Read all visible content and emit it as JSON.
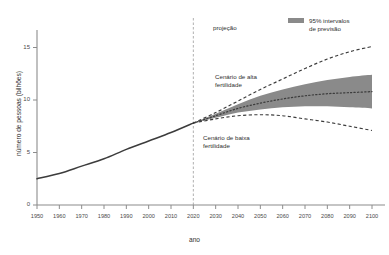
{
  "chart_data": {
    "type": "line",
    "title": "",
    "xlabel": "ano",
    "ylabel": "número de pessoas (bilhões)",
    "xlim": [
      1950,
      2100
    ],
    "ylim": [
      0,
      17
    ],
    "grid": false,
    "legend_position": "top-right",
    "x_ticks": [
      1950,
      1960,
      1970,
      1980,
      1990,
      2000,
      2010,
      2020,
      2030,
      2040,
      2050,
      2060,
      2070,
      2080,
      2090,
      2100
    ],
    "y_ticks": [
      0,
      5,
      10,
      15
    ],
    "projection_start_year": 2020,
    "legend": [
      {
        "label_line1": "95% intervalos",
        "label_line2": "de previsão",
        "color": "#8a8a8a",
        "style": "band"
      }
    ],
    "annotations": [
      {
        "id": "projecao",
        "text": "projeção",
        "x": 2022,
        "y": 16.2
      },
      {
        "id": "alta-fertilidade",
        "line1": "Cenário de alta",
        "line2": "fertilidade",
        "x": 2024,
        "y": 11.6
      },
      {
        "id": "baixa-fertilidade",
        "line1": "Cenário de baixa",
        "line2": "fertilidade",
        "x": 2020,
        "y": 5.9
      }
    ],
    "series": [
      {
        "name": "histórico",
        "style": "solid",
        "color": "#3c3c3c",
        "x": [
          1950,
          1960,
          1970,
          1980,
          1990,
          2000,
          2010,
          2020
        ],
        "values": [
          2.5,
          3.0,
          3.7,
          4.4,
          5.3,
          6.1,
          6.9,
          7.8
        ]
      },
      {
        "name": "mediana da projeção",
        "style": "dotted",
        "color": "#3c3c3c",
        "x": [
          2020,
          2030,
          2040,
          2050,
          2060,
          2070,
          2080,
          2090,
          2100
        ],
        "values": [
          7.8,
          8.5,
          9.2,
          9.7,
          10.1,
          10.4,
          10.6,
          10.7,
          10.8
        ]
      },
      {
        "name": "Cenário de alta fertilidade",
        "style": "dashed",
        "color": "#3c3c3c",
        "x": [
          2020,
          2030,
          2040,
          2050,
          2060,
          2070,
          2080,
          2090,
          2100
        ],
        "values": [
          7.8,
          8.8,
          9.9,
          11.0,
          12.0,
          13.0,
          13.9,
          14.6,
          15.1
        ]
      },
      {
        "name": "Cenário de baixa fertilidade",
        "style": "dashed",
        "color": "#3c3c3c",
        "x": [
          2020,
          2030,
          2040,
          2050,
          2060,
          2070,
          2080,
          2090,
          2100
        ],
        "values": [
          7.8,
          8.2,
          8.5,
          8.6,
          8.5,
          8.2,
          7.9,
          7.5,
          7.1
        ]
      },
      {
        "name": "95% intervalos de previsão (superior)",
        "style": "band-upper",
        "color": "#8a8a8a",
        "x": [
          2020,
          2030,
          2040,
          2050,
          2060,
          2070,
          2080,
          2090,
          2100
        ],
        "values": [
          7.8,
          8.7,
          9.6,
          10.4,
          11.0,
          11.5,
          11.9,
          12.2,
          12.4
        ]
      },
      {
        "name": "95% intervalos de previsão (inferior)",
        "style": "band-lower",
        "color": "#8a8a8a",
        "x": [
          2020,
          2030,
          2040,
          2050,
          2060,
          2070,
          2080,
          2090,
          2100
        ],
        "values": [
          7.8,
          8.3,
          8.8,
          9.1,
          9.3,
          9.4,
          9.4,
          9.3,
          9.2
        ]
      }
    ]
  },
  "axes": {
    "x_tick_labels": [
      "1950",
      "1960",
      "1970",
      "1980",
      "1990",
      "2000",
      "2010",
      "2020",
      "2030",
      "2040",
      "2050",
      "2060",
      "2070",
      "2080",
      "2090",
      "2100"
    ],
    "y_tick_labels": [
      "0",
      "5",
      "10",
      "15"
    ],
    "x_title": "ano",
    "y_title": "número de pessoas (bilhões)"
  },
  "annotations": {
    "projecao": "projeção",
    "alta_line1": "Cenário de alta",
    "alta_line2": "fertilidade",
    "baixa_line1": "Cenário de baixa",
    "baixa_line2": "fertilidade"
  },
  "legend": {
    "line1": "95% intervalos",
    "line2": "de previsão",
    "swatch_color": "#8a8a8a"
  }
}
